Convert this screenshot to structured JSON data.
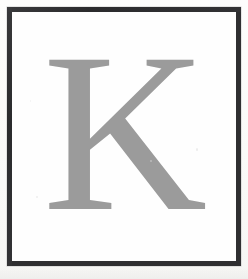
{
  "page": {
    "kind": "scanned-plate",
    "background_color": "#fbfbfa",
    "width": 248,
    "height": 279
  },
  "frame": {
    "name": "printed-rule-border",
    "border_color": "#2f2f31",
    "border_width_px": 5,
    "fill_color": "#ffffff",
    "inset_px": 7
  },
  "glyph": {
    "character": "K",
    "label": "capital-letter-k",
    "color": "#9b9b9b",
    "style": "serif",
    "case": "uppercase",
    "font_size_px": 228
  },
  "artifacts": {
    "speck_color": "#dcdcdc",
    "count": 4
  }
}
